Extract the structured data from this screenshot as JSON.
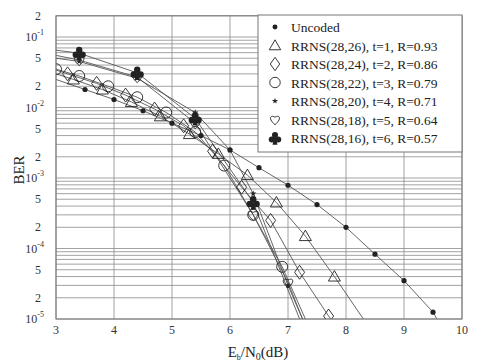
{
  "chart_data": {
    "type": "line",
    "title": "",
    "xlabel": "Eb/N0(dB)",
    "ylabel": "BER",
    "xscale": "linear",
    "yscale": "log",
    "xlim": [
      3,
      10
    ],
    "ylim": [
      1e-05,
      0.2
    ],
    "x_ticks": [
      3,
      4,
      5,
      6,
      7,
      8,
      9,
      10
    ],
    "y_major_ticks": [
      {
        "value": 0.2,
        "label": "2"
      },
      {
        "value": 0.1,
        "base": "10",
        "exp": "-1"
      },
      {
        "value": 0.05,
        "label": "5"
      },
      {
        "value": 0.02,
        "label": "2"
      },
      {
        "value": 0.01,
        "base": "10",
        "exp": "-2"
      },
      {
        "value": 0.005,
        "label": "5"
      },
      {
        "value": 0.002,
        "label": "2"
      },
      {
        "value": 0.001,
        "base": "10",
        "exp": "-3"
      },
      {
        "value": 0.0005,
        "label": "5"
      },
      {
        "value": 0.0002,
        "label": "2"
      },
      {
        "value": 0.0001,
        "base": "10",
        "exp": "-4"
      },
      {
        "value": 5e-05,
        "label": "5"
      },
      {
        "value": 2e-05,
        "label": "2"
      },
      {
        "value": 1e-05,
        "base": "10",
        "exp": "-5"
      }
    ],
    "grid": true,
    "legend_position": "upper right",
    "series": [
      {
        "name": "Uncoded",
        "marker": "filled-circle",
        "x": [
          3.5,
          4.0,
          4.5,
          5.0,
          5.5,
          6.0,
          6.5,
          7.0,
          7.5,
          8.0,
          8.5,
          9.0,
          9.5
        ],
        "y": [
          0.018,
          0.013,
          0.009,
          0.006,
          0.004,
          0.0025,
          0.0014,
          0.00079,
          0.00042,
          0.0002,
          8.3e-05,
          3.5e-05,
          1.25e-05
        ],
        "line_x": [
          3.0,
          9.6
        ],
        "line_y": [
          0.025,
          9e-06
        ]
      },
      {
        "name": "RRNS(28,26), t=1, R=0.93",
        "marker": "triangle",
        "x": [
          3.3,
          3.8,
          4.3,
          4.8,
          5.3,
          5.8,
          6.3,
          6.8,
          7.3,
          7.8
        ],
        "y": [
          0.025,
          0.018,
          0.012,
          0.0075,
          0.0042,
          0.0022,
          0.0011,
          0.00045,
          0.00015,
          4e-05
        ],
        "line_x": [
          3.0,
          8.3
        ],
        "line_y": [
          0.03,
          1e-05
        ]
      },
      {
        "name": "RRNS(28,24), t=2, R=0.86",
        "marker": "diamond",
        "x": [
          3.2,
          3.7,
          4.2,
          4.7,
          5.2,
          5.7,
          6.2,
          6.7,
          7.2,
          7.7
        ],
        "y": [
          0.03,
          0.022,
          0.015,
          0.0095,
          0.0055,
          0.0024,
          0.00074,
          0.00025,
          4.6e-05,
          1.1e-05
        ],
        "line_x": [
          3.0,
          7.8
        ],
        "line_y": [
          0.034,
          8.5e-06
        ]
      },
      {
        "name": "RRNS(28,22), t=3, R=0.79",
        "marker": "circle",
        "x": [
          3.0,
          3.4,
          3.9,
          4.4,
          4.9,
          5.4,
          5.9,
          6.4,
          6.9
        ],
        "y": [
          0.035,
          0.028,
          0.02,
          0.014,
          0.0085,
          0.0045,
          0.0015,
          0.0003,
          5.5e-05
        ],
        "line_x": [
          3.0,
          7.3
        ],
        "line_y": [
          0.036,
          1e-05
        ]
      },
      {
        "name": "RRNS(28,20), t=4, R=0.71",
        "marker": "star",
        "x": [
          3.4,
          4.4,
          5.4,
          6.0,
          6.4,
          7.0
        ],
        "y": [
          0.045,
          0.026,
          0.0085,
          0.0025,
          0.0006,
          3e-05
        ],
        "line_x": [
          3.0,
          7.25
        ],
        "line_y": [
          0.05,
          1e-05
        ]
      },
      {
        "name": "RRNS(28,18), t=5, R=0.64",
        "marker": "heart",
        "x": [
          3.4,
          4.4,
          5.4,
          6.4,
          7.0
        ],
        "y": [
          0.047,
          0.027,
          0.006,
          0.0003,
          3.3e-05
        ],
        "line_x": [
          3.0,
          7.25
        ],
        "line_y": [
          0.055,
          1e-05
        ]
      },
      {
        "name": "RRNS(28,16), t=6, R=0.57",
        "marker": "club",
        "x": [
          3.4,
          4.4,
          5.4,
          6.4
        ],
        "y": [
          0.059,
          0.031,
          0.007,
          0.00045
        ],
        "line_x": [
          3.0,
          7.2
        ],
        "line_y": [
          0.065,
          1e-05
        ]
      }
    ]
  },
  "axes": {
    "xlabel_main": "E",
    "xlabel_sub1": "b",
    "xlabel_mid": "/N",
    "xlabel_sub2": "0",
    "xlabel_tail": "(dB)",
    "ylabel": "BER"
  },
  "legend": {
    "items": [
      {
        "label": "Uncoded",
        "marker": "filled-circle"
      },
      {
        "label": "RRNS(28,26), t=1, R=0.93",
        "marker": "triangle"
      },
      {
        "label": "RRNS(28,24), t=2, R=0.86",
        "marker": "diamond"
      },
      {
        "label": "RRNS(28,22), t=3, R=0.79",
        "marker": "circle"
      },
      {
        "label": "RRNS(28,20), t=4, R=0.71",
        "marker": "star"
      },
      {
        "label": "RRNS(28,18), t=5, R=0.64",
        "marker": "heart"
      },
      {
        "label": "RRNS(28,16), t=6, R=0.57",
        "marker": "club"
      }
    ]
  },
  "colors": {
    "grid": "#8a8a8a",
    "line": "#555555",
    "marker": "#222222",
    "frame": "#777777"
  }
}
